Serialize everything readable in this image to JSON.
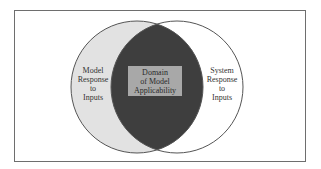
{
  "diagram": {
    "type": "venn",
    "left_set": {
      "label_lines": [
        "Model",
        "Response",
        "to",
        "Inputs"
      ],
      "label": "Model Response to Inputs",
      "fill": "#e2e2e2"
    },
    "right_set": {
      "label_lines": [
        "System",
        "Response",
        "to",
        "Inputs"
      ],
      "label": "System Response to Inputs",
      "fill": "#ffffff"
    },
    "intersection": {
      "label_lines": [
        "Domain",
        "of Model",
        "Applicability"
      ],
      "label": "Domain of Model Applicability",
      "fill": "#3e3e3e",
      "label_box_fill": "#a8a8a8"
    },
    "outline_color": "#555555"
  }
}
